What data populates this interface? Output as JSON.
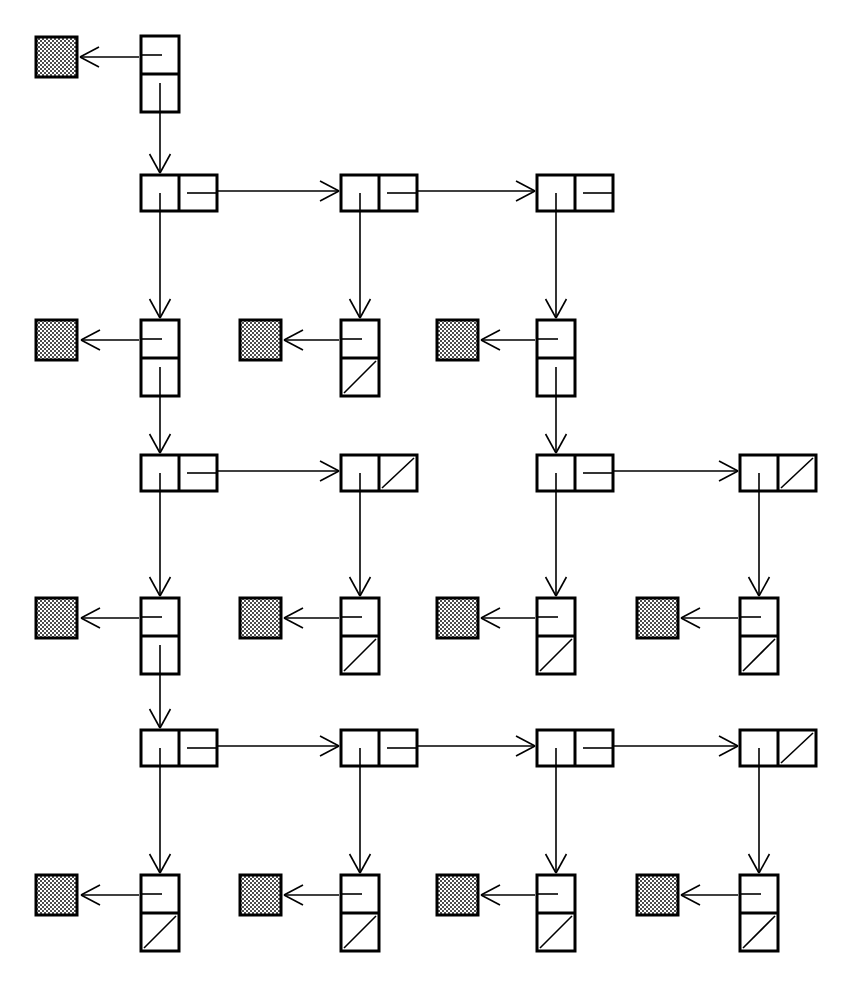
{
  "figure": {
    "title": "Linked list of lists structure diagram",
    "background_color": "#ffffff",
    "stroke_color": "#000000",
    "shaded_fill_color": "#808080",
    "canvas": {
      "width": 846,
      "height": 984
    }
  },
  "legend": {
    "list_node_label": "list node (two cells: head pointer, next pointer)",
    "element_node_label": "element node (two cells: data pointer, next pointer)",
    "data_block_label": "data block (shaded square)",
    "null_marker_label": "null pointer (diagonal slash)"
  },
  "geometry": {
    "columns_x": [
      141,
      341,
      537,
      740
    ],
    "list_node": {
      "width": 76,
      "height": 36,
      "cell_width": 38
    },
    "element_node": {
      "width": 38,
      "height": 76,
      "cell_height": 38
    },
    "data_block": {
      "width": 41,
      "height": 40
    },
    "rows_y": [
      36,
      175,
      320,
      455,
      598,
      730,
      875
    ],
    "data_block_x": [
      36,
      240,
      437,
      637
    ],
    "stroke_width_node": 3,
    "stroke_width_edge": 1.6
  },
  "rows": [
    {
      "id": "row-1",
      "kind": "element",
      "y": 36,
      "nodes": [
        {
          "col": 0,
          "x": 141,
          "type": "element-node",
          "top_cell": "data-pointer",
          "bottom_cell": "next-pointer",
          "top_null": false,
          "bottom_null": false,
          "data_block": {
            "x": 36,
            "y": 37,
            "shaded": true
          }
        }
      ]
    },
    {
      "id": "row-2",
      "kind": "list",
      "y": 175,
      "nodes": [
        {
          "col": 0,
          "x": 141,
          "type": "list-node",
          "left_cell": "head-pointer",
          "right_cell": "next-pointer",
          "right_null": false,
          "next_to_col": 1
        },
        {
          "col": 1,
          "x": 341,
          "type": "list-node",
          "left_cell": "head-pointer",
          "right_cell": "next-pointer",
          "right_null": false,
          "next_to_col": 2
        },
        {
          "col": 2,
          "x": 537,
          "type": "list-node",
          "left_cell": "head-pointer",
          "right_cell": "next-pointer",
          "right_null": false,
          "next_to_col": null
        }
      ]
    },
    {
      "id": "row-3",
      "kind": "element",
      "y": 320,
      "nodes": [
        {
          "col": 0,
          "x": 141,
          "type": "element-node",
          "top_null": false,
          "bottom_null": false,
          "data_block": {
            "x": 36,
            "y": 320,
            "shaded": true
          }
        },
        {
          "col": 1,
          "x": 341,
          "type": "element-node",
          "top_null": false,
          "bottom_null": true,
          "data_block": {
            "x": 240,
            "y": 320,
            "shaded": true
          }
        },
        {
          "col": 2,
          "x": 537,
          "type": "element-node",
          "top_null": false,
          "bottom_null": false,
          "data_block": {
            "x": 437,
            "y": 320,
            "shaded": true
          }
        }
      ]
    },
    {
      "id": "row-4",
      "kind": "list",
      "y": 455,
      "nodes": [
        {
          "col": 0,
          "x": 141,
          "type": "list-node",
          "right_null": false,
          "next_to_col": 1
        },
        {
          "col": 1,
          "x": 341,
          "type": "list-node",
          "right_null": true,
          "next_to_col": null
        },
        {
          "col": 2,
          "x": 537,
          "type": "list-node",
          "right_null": false,
          "next_to_col": 3
        },
        {
          "col": 3,
          "x": 740,
          "type": "list-node",
          "right_null": true,
          "next_to_col": null
        }
      ]
    },
    {
      "id": "row-5",
      "kind": "element",
      "y": 598,
      "nodes": [
        {
          "col": 0,
          "x": 141,
          "type": "element-node",
          "bottom_null": false,
          "data_block": {
            "x": 36,
            "y": 598,
            "shaded": true
          }
        },
        {
          "col": 1,
          "x": 341,
          "type": "element-node",
          "bottom_null": true,
          "data_block": {
            "x": 240,
            "y": 598,
            "shaded": true
          }
        },
        {
          "col": 2,
          "x": 537,
          "type": "element-node",
          "bottom_null": true,
          "data_block": {
            "x": 437,
            "y": 598,
            "shaded": true
          }
        },
        {
          "col": 3,
          "x": 740,
          "type": "element-node",
          "bottom_null": true,
          "data_block": {
            "x": 637,
            "y": 598,
            "shaded": true
          }
        }
      ]
    },
    {
      "id": "row-6",
      "kind": "list",
      "y": 730,
      "nodes": [
        {
          "col": 0,
          "x": 141,
          "type": "list-node",
          "right_null": false,
          "next_to_col": 1
        },
        {
          "col": 1,
          "x": 341,
          "type": "list-node",
          "right_null": false,
          "next_to_col": 2
        },
        {
          "col": 2,
          "x": 537,
          "type": "list-node",
          "right_null": false,
          "next_to_col": 3
        },
        {
          "col": 3,
          "x": 740,
          "type": "list-node",
          "right_null": true,
          "next_to_col": null
        }
      ]
    },
    {
      "id": "row-7",
      "kind": "element",
      "y": 875,
      "nodes": [
        {
          "col": 0,
          "x": 141,
          "type": "element-node",
          "bottom_null": true,
          "data_block": {
            "x": 36,
            "y": 875,
            "shaded": true
          }
        },
        {
          "col": 1,
          "x": 341,
          "type": "element-node",
          "bottom_null": true,
          "data_block": {
            "x": 240,
            "y": 875,
            "shaded": true
          }
        },
        {
          "col": 2,
          "x": 537,
          "type": "element-node",
          "bottom_null": true,
          "data_block": {
            "x": 437,
            "y": 875,
            "shaded": true
          }
        },
        {
          "col": 3,
          "x": 740,
          "type": "element-node",
          "bottom_null": true,
          "data_block": {
            "x": 637,
            "y": 875,
            "shaded": true
          }
        }
      ]
    }
  ],
  "vertical_edges": [
    {
      "from": "row-1.col-0",
      "to": "row-2.col-0",
      "x": 160,
      "y1": 113,
      "y2": 173
    },
    {
      "from": "row-2.col-0",
      "to": "row-3.col-0",
      "x": 160,
      "y1": 211,
      "y2": 318
    },
    {
      "from": "row-2.col-1",
      "to": "row-3.col-1",
      "x": 360,
      "y1": 211,
      "y2": 318
    },
    {
      "from": "row-2.col-2",
      "to": "row-3.col-2",
      "x": 556,
      "y1": 211,
      "y2": 318
    },
    {
      "from": "row-3.col-0",
      "to": "row-4.col-0",
      "x": 160,
      "y1": 396,
      "y2": 453
    },
    {
      "from": "row-3.col-2",
      "to": "row-4.col-2",
      "x": 556,
      "y1": 396,
      "y2": 453
    },
    {
      "from": "row-4.col-0",
      "to": "row-5.col-0",
      "x": 160,
      "y1": 491,
      "y2": 596
    },
    {
      "from": "row-4.col-1",
      "to": "row-5.col-1",
      "x": 360,
      "y1": 491,
      "y2": 596
    },
    {
      "from": "row-4.col-2",
      "to": "row-5.col-2",
      "x": 556,
      "y1": 491,
      "y2": 596
    },
    {
      "from": "row-4.col-3",
      "to": "row-5.col-3",
      "x": 759,
      "y1": 491,
      "y2": 596
    },
    {
      "from": "row-5.col-0",
      "to": "row-6.col-0",
      "x": 160,
      "y1": 674,
      "y2": 728
    },
    {
      "from": "row-6.col-0",
      "to": "row-7.col-0",
      "x": 160,
      "y1": 766,
      "y2": 873
    },
    {
      "from": "row-6.col-1",
      "to": "row-7.col-1",
      "x": 360,
      "y1": 766,
      "y2": 873
    },
    {
      "from": "row-6.col-2",
      "to": "row-7.col-2",
      "x": 556,
      "y1": 766,
      "y2": 873
    },
    {
      "from": "row-6.col-3",
      "to": "row-7.col-3",
      "x": 759,
      "y1": 766,
      "y2": 873
    }
  ],
  "horizontal_edges": [
    {
      "row": "row-2",
      "from_col": 0,
      "to_col": 1,
      "x1": 198,
      "x2": 339,
      "y": 191
    },
    {
      "row": "row-2",
      "from_col": 1,
      "to_col": 2,
      "x1": 398,
      "x2": 535,
      "y": 191
    },
    {
      "row": "row-4",
      "from_col": 0,
      "to_col": 1,
      "x1": 198,
      "x2": 339,
      "y": 471
    },
    {
      "row": "row-4",
      "from_col": 2,
      "to_col": 3,
      "x1": 594,
      "x2": 738,
      "y": 471
    },
    {
      "row": "row-6",
      "from_col": 0,
      "to_col": 1,
      "x1": 198,
      "x2": 339,
      "y": 746
    },
    {
      "row": "row-6",
      "from_col": 1,
      "to_col": 2,
      "x1": 398,
      "x2": 535,
      "y": 746
    },
    {
      "row": "row-6",
      "from_col": 2,
      "to_col": 3,
      "x1": 594,
      "x2": 738,
      "y": 746
    }
  ],
  "data_edges": [
    {
      "row": "row-1",
      "col": 0,
      "x1": 139,
      "x2": 80,
      "y": 57
    },
    {
      "row": "row-3",
      "col": 0,
      "x1": 139,
      "x2": 81,
      "y": 340
    },
    {
      "row": "row-3",
      "col": 1,
      "x1": 339,
      "x2": 284,
      "y": 340
    },
    {
      "row": "row-3",
      "col": 2,
      "x1": 535,
      "x2": 481,
      "y": 340
    },
    {
      "row": "row-5",
      "col": 0,
      "x1": 139,
      "x2": 81,
      "y": 618
    },
    {
      "row": "row-5",
      "col": 1,
      "x1": 339,
      "x2": 284,
      "y": 618
    },
    {
      "row": "row-5",
      "col": 2,
      "x1": 535,
      "x2": 481,
      "y": 618
    },
    {
      "row": "row-5",
      "col": 3,
      "x1": 738,
      "x2": 681,
      "y": 618
    },
    {
      "row": "row-7",
      "col": 0,
      "x1": 139,
      "x2": 81,
      "y": 895
    },
    {
      "row": "row-7",
      "col": 1,
      "x1": 339,
      "x2": 284,
      "y": 895
    },
    {
      "row": "row-7",
      "col": 2,
      "x1": 535,
      "x2": 481,
      "y": 895
    },
    {
      "row": "row-7",
      "col": 3,
      "x1": 738,
      "x2": 681,
      "y": 895
    }
  ]
}
